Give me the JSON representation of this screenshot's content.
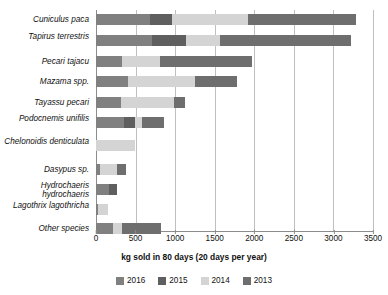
{
  "chart_data": {
    "type": "bar",
    "orientation": "horizontal",
    "stacked": true,
    "title": "",
    "xlabel": "kg sold in 80 days (20 days per year)",
    "ylabel": "",
    "xlim": [
      0,
      3500
    ],
    "xticks": [
      0,
      500,
      1000,
      1500,
      2000,
      2500,
      3000,
      3500
    ],
    "grid": true,
    "legend_position": "bottom",
    "categories": [
      "Cuniculus paca",
      "Tapirus terrestris",
      "Pecari tajacu",
      "Mazama spp.",
      "Tayassu pecari",
      "Podocnemis unifilis",
      "Chelonoidis denticulata",
      "Dasypus sp.",
      "Hydrochaeris hydrochaeris",
      "Lagothrix lagothricha",
      "Other species"
    ],
    "series": [
      {
        "name": "2016",
        "color": "#808080",
        "values": [
          680,
          710,
          330,
          400,
          320,
          355,
          0,
          45,
          165,
          30,
          215
        ]
      },
      {
        "name": "2015",
        "color": "#5f5f5f",
        "values": [
          280,
          430,
          0,
          0,
          0,
          140,
          0,
          0,
          95,
          0,
          0
        ]
      },
      {
        "name": "2014",
        "color": "#d4d4d4",
        "values": [
          960,
          430,
          480,
          845,
          660,
          90,
          495,
          215,
          0,
          125,
          110
        ]
      },
      {
        "name": "2013",
        "color": "#6e6e6e",
        "values": [
          1365,
          1655,
          1165,
          540,
          150,
          270,
          0,
          125,
          0,
          0,
          495
        ]
      }
    ],
    "totals": [
      3285,
      3225,
      1975,
      1785,
      1130,
      855,
      495,
      385,
      260,
      155,
      820
    ]
  },
  "legend": {
    "items": [
      {
        "label": "2016",
        "color": "#808080"
      },
      {
        "label": "2015",
        "color": "#5f5f5f"
      },
      {
        "label": "2014",
        "color": "#d4d4d4"
      },
      {
        "label": "2013",
        "color": "#6e6e6e"
      }
    ]
  },
  "axis": {
    "x_title": "kg sold in 80 days (20 days per year)",
    "tick_labels": [
      "0",
      "500",
      "1000",
      "1500",
      "2000",
      "2500",
      "3000",
      "3500"
    ]
  }
}
